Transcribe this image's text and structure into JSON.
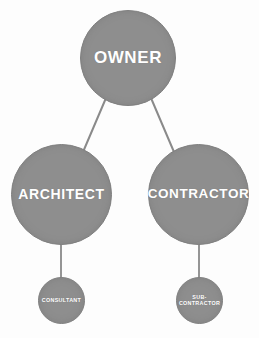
{
  "diagram": {
    "type": "hierarchy-tree",
    "background_color": "#fdfdfd",
    "node_fill_color": "#8e8e8e",
    "node_text_color": "#ffffff",
    "edge_color": "#8a8a8a",
    "nodes": [
      {
        "id": "owner",
        "label": "OWNER",
        "tier": "primary",
        "level": 1
      },
      {
        "id": "architect",
        "label": "ARCHITECT",
        "tier": "primary",
        "level": 2
      },
      {
        "id": "contractor",
        "label": "CONTRACTOR",
        "tier": "primary",
        "level": 2
      },
      {
        "id": "consultant",
        "label": "CONSULTANT",
        "tier": "secondary",
        "level": 3
      },
      {
        "id": "subcontractor",
        "label_line1": "SUB-",
        "label_line2": "CONTRACTOR",
        "tier": "secondary",
        "level": 3
      }
    ],
    "edges": [
      {
        "from": "owner",
        "to": "architect",
        "style": "diagonal"
      },
      {
        "from": "owner",
        "to": "contractor",
        "style": "diagonal"
      },
      {
        "from": "architect",
        "to": "consultant",
        "style": "vertical"
      },
      {
        "from": "contractor",
        "to": "subcontractor",
        "style": "vertical"
      }
    ]
  }
}
